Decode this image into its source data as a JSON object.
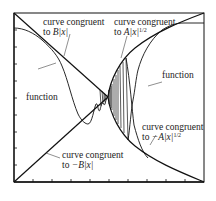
{
  "diagram": {
    "type": "function bounded by envelopes",
    "frame": {
      "left_ticks": 9,
      "bottom_ticks": 9
    },
    "labels": {
      "upper_left": {
        "line1": "curve congruent",
        "line2_prefix": "to ",
        "expr": "B|x|"
      },
      "upper_right": {
        "line1": "curve congruent",
        "line2_prefix": "to ",
        "expr": "A|x|",
        "exponent": "1/2"
      },
      "function_left": "function",
      "function_right": "function",
      "lower_right": {
        "line1": "curve congruent",
        "line2_prefix": "to ",
        "expr": "−A|x|",
        "exponent": "1/2"
      },
      "lower_left": {
        "line1": "curve congruent",
        "line2_prefix": "to ",
        "expr": "−B|x|"
      }
    },
    "colors": {
      "line": "#111111",
      "background": "#ffffff"
    }
  }
}
